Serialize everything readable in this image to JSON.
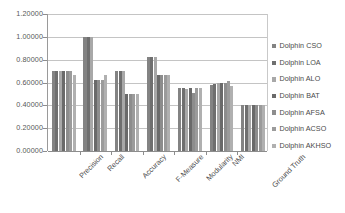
{
  "chart_data": {
    "type": "bar",
    "title": "",
    "subtitle": "",
    "xlabel": "",
    "ylabel": "",
    "grid": true,
    "legend_position": "right",
    "ylim": [
      0,
      1.2
    ],
    "categories": [
      "Precision",
      "Recall",
      "Accuracy",
      "F-Measure",
      "Modularity",
      "NMI",
      "Ground Truth"
    ],
    "y_ticks": [
      "0.00000",
      "0.20000",
      "0.40000",
      "0.60000",
      "0.80000",
      "1.00000",
      "1.20000"
    ],
    "y_tick_values": [
      0,
      0.2,
      0.4,
      0.6,
      0.8,
      1.0,
      1.2
    ],
    "series": [
      {
        "name": "Dolphin CSO",
        "color": "#838383",
        "values": [
          0.705,
          0.998,
          0.705,
          0.822,
          0.548,
          0.578,
          0.402
        ]
      },
      {
        "name": "Dolphin LOA",
        "color": "#6f6f6f",
        "values": [
          0.705,
          0.998,
          0.705,
          0.822,
          0.548,
          0.586,
          0.402
        ]
      },
      {
        "name": "Dolphin ALO",
        "color": "#a8a8a8",
        "values": [
          0.705,
          0.998,
          0.705,
          0.822,
          0.542,
          0.592,
          0.402
        ]
      },
      {
        "name": "Dolphin BAT",
        "color": "#6a6a6a",
        "values": [
          0.705,
          0.622,
          0.498,
          0.664,
          0.548,
          0.592,
          0.402
        ]
      },
      {
        "name": "Dolphin AFSA",
        "color": "#8d8d8d",
        "values": [
          0.705,
          0.622,
          0.498,
          0.664,
          0.51,
          0.592,
          0.402
        ]
      },
      {
        "name": "Dolphin ACSO",
        "color": "#9b9b9b",
        "values": [
          0.705,
          0.622,
          0.498,
          0.664,
          0.554,
          0.61,
          0.402
        ]
      },
      {
        "name": "Dolphin AKHSO",
        "color": "#b0b0b0",
        "values": [
          0.664,
          0.664,
          0.498,
          0.664,
          0.548,
          0.568,
          0.402
        ]
      }
    ]
  }
}
